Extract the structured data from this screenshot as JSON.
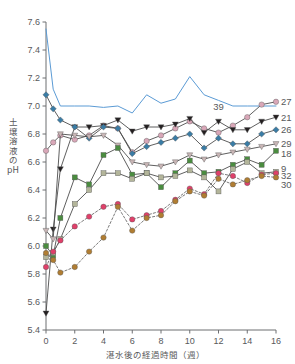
{
  "chart_data": {
    "type": "line",
    "title": "",
    "xlabel": "湛水後の経過時間（週）",
    "ylabel": "土壌溶液のpH",
    "xlim": [
      0,
      16
    ],
    "ylim": [
      5.4,
      7.6
    ],
    "xticks": [
      0,
      2,
      4,
      6,
      8,
      10,
      12,
      14,
      16
    ],
    "yticks": [
      5.4,
      5.6,
      5.8,
      6.0,
      6.2,
      6.4,
      6.6,
      6.8,
      7.0,
      7.2,
      7.4,
      7.6
    ],
    "grid": false,
    "legend_position": "right-inline",
    "x": [
      0,
      0.5,
      1,
      2,
      3,
      4,
      5,
      6,
      7,
      8,
      9,
      10,
      11,
      12,
      13,
      14,
      15,
      16
    ],
    "series": [
      {
        "name": "39",
        "label": "39",
        "color": "#5b9bd5",
        "marker": "none",
        "dash": false,
        "label_x": 12.0,
        "label_y": 7.0,
        "values": [
          7.55,
          7.12,
          7.0,
          7.0,
          7.0,
          6.99,
          7.0,
          6.95,
          7.08,
          7.02,
          7.05,
          7.21,
          7.08,
          7.04,
          7.0,
          7.0,
          7.0,
          7.0
        ]
      },
      {
        "name": "27",
        "label": "27",
        "color": "#d9a7b8",
        "marker": "circle",
        "dash": false,
        "values": [
          6.68,
          6.74,
          6.79,
          6.76,
          6.79,
          6.86,
          6.84,
          6.67,
          6.75,
          6.79,
          6.84,
          6.89,
          6.84,
          6.81,
          6.86,
          6.92,
          7.01,
          7.03
        ]
      },
      {
        "name": "21",
        "label": "21",
        "color": "#231f20",
        "marker": "triangle-down",
        "dash": false,
        "values": [
          5.52,
          6.12,
          6.55,
          6.85,
          6.85,
          6.86,
          6.9,
          6.82,
          6.85,
          6.85,
          6.87,
          6.91,
          6.81,
          6.89,
          6.83,
          6.83,
          6.89,
          6.92
        ]
      },
      {
        "name": "26",
        "label": "26",
        "color": "#3a7ca5",
        "marker": "diamond",
        "dash": false,
        "values": [
          7.08,
          6.98,
          6.9,
          6.85,
          6.77,
          6.85,
          6.84,
          6.66,
          6.71,
          6.74,
          6.77,
          6.8,
          6.7,
          6.77,
          6.73,
          6.73,
          6.8,
          6.83
        ]
      },
      {
        "name": "29",
        "label": "29",
        "color": "#c9b6b6",
        "marker": "triangle-down",
        "dash": false,
        "values": [
          6.11,
          6.05,
          6.8,
          6.79,
          6.78,
          6.79,
          6.72,
          6.6,
          6.58,
          6.57,
          6.6,
          6.65,
          6.62,
          6.65,
          6.67,
          6.69,
          6.71,
          6.73
        ]
      },
      {
        "name": "18",
        "label": "18",
        "color": "#4a8c3f",
        "marker": "square",
        "dash": false,
        "values": [
          6.0,
          5.93,
          6.2,
          6.49,
          6.44,
          6.65,
          6.7,
          6.51,
          6.52,
          6.42,
          6.52,
          6.61,
          6.52,
          6.53,
          6.58,
          6.62,
          6.58,
          6.68
        ]
      },
      {
        "name": "9",
        "label": "9",
        "color": "#b3b59a",
        "marker": "square",
        "dash": false,
        "values": [
          5.92,
          5.95,
          6.05,
          6.3,
          6.4,
          6.52,
          6.52,
          6.48,
          6.52,
          6.49,
          6.5,
          6.54,
          6.49,
          6.39,
          6.55,
          6.6,
          6.52,
          6.53
        ]
      },
      {
        "name": "32",
        "label": "32",
        "color": "#e0406a",
        "marker": "circle",
        "dash": true,
        "values": [
          5.85,
          5.96,
          6.04,
          6.14,
          6.21,
          6.28,
          6.3,
          6.19,
          6.22,
          6.25,
          6.33,
          6.41,
          6.37,
          6.52,
          6.5,
          6.45,
          6.51,
          6.52
        ]
      },
      {
        "name": "30",
        "label": "30",
        "color": "#b07d32",
        "marker": "circle",
        "dash": true,
        "values": [
          5.95,
          5.9,
          5.81,
          5.85,
          5.96,
          6.06,
          6.28,
          6.11,
          6.2,
          6.22,
          6.32,
          6.39,
          6.36,
          6.48,
          6.44,
          6.47,
          6.5,
          6.49
        ]
      }
    ],
    "right_labels": [
      {
        "text": "27",
        "y": 7.03
      },
      {
        "text": "21",
        "y": 6.92
      },
      {
        "text": "26",
        "y": 6.83
      },
      {
        "text": "29",
        "y": 6.73
      },
      {
        "text": "18",
        "y": 6.66
      },
      {
        "text": "9",
        "y": 6.555
      },
      {
        "text": "32",
        "y": 6.5
      },
      {
        "text": "30",
        "y": 6.44
      }
    ]
  }
}
